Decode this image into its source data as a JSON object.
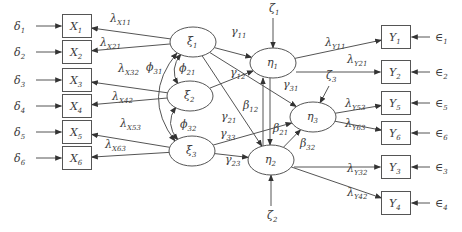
{
  "diagram": {
    "title": "",
    "exogenous_indicators": [
      {
        "id": "X1",
        "label": "X",
        "sub": "1",
        "error": {
          "label": "δ",
          "sub": "1"
        }
      },
      {
        "id": "X2",
        "label": "X",
        "sub": "2",
        "error": {
          "label": "δ",
          "sub": "2"
        }
      },
      {
        "id": "X3",
        "label": "X",
        "sub": "3",
        "error": {
          "label": "δ",
          "sub": "3"
        }
      },
      {
        "id": "X4",
        "label": "X",
        "sub": "4",
        "error": {
          "label": "δ",
          "sub": "4"
        }
      },
      {
        "id": "X5",
        "label": "X",
        "sub": "5",
        "error": {
          "label": "δ",
          "sub": "5"
        }
      },
      {
        "id": "X6",
        "label": "X",
        "sub": "6",
        "error": {
          "label": "δ",
          "sub": "6"
        }
      }
    ],
    "exogenous_latents": [
      {
        "id": "xi1",
        "label": "ξ",
        "sub": "1"
      },
      {
        "id": "xi2",
        "label": "ξ",
        "sub": "2"
      },
      {
        "id": "xi3",
        "label": "ξ",
        "sub": "3"
      }
    ],
    "endogenous_latents": [
      {
        "id": "eta1",
        "label": "η",
        "sub": "1",
        "disturbance": {
          "label": "ζ",
          "sub": "1"
        }
      },
      {
        "id": "eta2",
        "label": "η",
        "sub": "2",
        "disturbance": {
          "label": "ζ",
          "sub": "2"
        }
      },
      {
        "id": "eta3",
        "label": "η",
        "sub": "3",
        "disturbance": {
          "label": "ζ",
          "sub": "3"
        }
      }
    ],
    "endogenous_indicators": [
      {
        "id": "Y1",
        "label": "Y",
        "sub": "1",
        "error": {
          "label": "∈",
          "sub": "1"
        }
      },
      {
        "id": "Y2",
        "label": "Y",
        "sub": "2",
        "error": {
          "label": "∈",
          "sub": "2"
        }
      },
      {
        "id": "Y5",
        "label": "Y",
        "sub": "5",
        "error": {
          "label": "∈",
          "sub": "5"
        }
      },
      {
        "id": "Y6",
        "label": "Y",
        "sub": "6",
        "error": {
          "label": "∈",
          "sub": "6"
        }
      },
      {
        "id": "Y3",
        "label": "Y",
        "sub": "3",
        "error": {
          "label": "∈",
          "sub": "3"
        }
      },
      {
        "id": "Y4",
        "label": "Y",
        "sub": "4",
        "error": {
          "label": "∈",
          "sub": "4"
        }
      }
    ],
    "x_loadings": [
      {
        "from": "xi1",
        "to": "X1",
        "label": "λ",
        "sub": "X11"
      },
      {
        "from": "xi1",
        "to": "X2",
        "label": "λ",
        "sub": "X21"
      },
      {
        "from": "xi2",
        "to": "X3",
        "label": "λ",
        "sub": "X32"
      },
      {
        "from": "xi2",
        "to": "X4",
        "label": "λ",
        "sub": "X42"
      },
      {
        "from": "xi3",
        "to": "X5",
        "label": "λ",
        "sub": "X53"
      },
      {
        "from": "xi3",
        "to": "X6",
        "label": "λ",
        "sub": "X63"
      }
    ],
    "covariances": [
      {
        "between": [
          "xi1",
          "xi2"
        ],
        "label": "ϕ",
        "sub": "21"
      },
      {
        "between": [
          "xi2",
          "xi3"
        ],
        "label": "ϕ",
        "sub": "32"
      },
      {
        "between": [
          "xi1",
          "xi3"
        ],
        "label": "ϕ",
        "sub": "31"
      }
    ],
    "gamma_paths": [
      {
        "from": "xi1",
        "to": "eta1",
        "label": "γ",
        "sub": "11"
      },
      {
        "from": "xi2",
        "to": "eta1",
        "label": "γ",
        "sub": "12"
      },
      {
        "from": "xi1",
        "to": "eta2",
        "label": "γ",
        "sub": "21"
      },
      {
        "from": "xi1",
        "to": "eta3",
        "label": "γ",
        "sub": "31"
      },
      {
        "from": "xi3",
        "to": "eta3",
        "label": "γ",
        "sub": "33"
      },
      {
        "from": "xi3",
        "to": "eta2",
        "label": "γ",
        "sub": "23"
      }
    ],
    "beta_paths": [
      {
        "from": "eta2",
        "to": "eta1",
        "label": "β",
        "sub": "12"
      },
      {
        "from": "eta1",
        "to": "eta2",
        "label": "β",
        "sub": "21"
      },
      {
        "from": "eta2",
        "to": "eta3",
        "label": "β",
        "sub": "32"
      }
    ],
    "y_loadings": [
      {
        "from": "eta1",
        "to": "Y1",
        "label": "λ",
        "sub": "Y11"
      },
      {
        "from": "eta1",
        "to": "Y2",
        "label": "λ",
        "sub": "Y21"
      },
      {
        "from": "eta3",
        "to": "Y5",
        "label": "λ",
        "sub": "Y53"
      },
      {
        "from": "eta3",
        "to": "Y6",
        "label": "λ",
        "sub": "Y63"
      },
      {
        "from": "eta2",
        "to": "Y3",
        "label": "λ",
        "sub": "Y32"
      },
      {
        "from": "eta2",
        "to": "Y4",
        "label": "λ",
        "sub": "Y42"
      }
    ]
  }
}
